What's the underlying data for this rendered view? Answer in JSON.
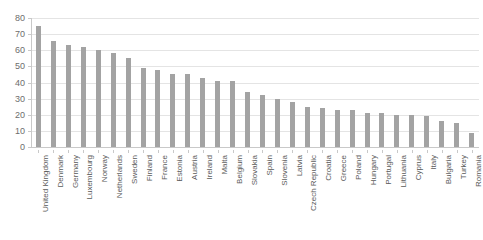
{
  "chart_data": {
    "type": "bar",
    "title": "",
    "subtitle": "",
    "xlabel": "",
    "ylabel": "",
    "ylim": [
      0,
      80
    ],
    "ytick_labels": [
      "0",
      "10",
      "20",
      "30",
      "40",
      "50",
      "60",
      "70",
      "80"
    ],
    "yticks": [
      0,
      10,
      20,
      30,
      40,
      50,
      60,
      70,
      80
    ],
    "grid": true,
    "legend": null,
    "legend_position": "none",
    "bar_color": "#a3a3a3",
    "background_color": "#ffffff",
    "axis_color": "#c9c9c9",
    "gridline_color": "#e4e4e4",
    "tick_label_color": "#6d6d6d",
    "category_label_color": "#5a5a5a",
    "category_label_rotation": -90,
    "categories": [
      "United Kingdom",
      "Denmark",
      "Germany",
      "Luxembourg",
      "Norway",
      "Netherlands",
      "Sweden",
      "Finland",
      "France",
      "Estonia",
      "Austria",
      "Ireland",
      "Malta",
      "Belgium",
      "Slovakia",
      "Spain",
      "Slovenia",
      "Latvia",
      "Czech Republic",
      "Croatia",
      "Greece",
      "Poland",
      "Hungary",
      "Portugal",
      "Lithuania",
      "Cyprus",
      "Italy",
      "Bulgaria",
      "Turkey",
      "Romania"
    ],
    "values": [
      75,
      66,
      63,
      62,
      60,
      58,
      55,
      49,
      48,
      45,
      45,
      43,
      41,
      41,
      34,
      32,
      30,
      28,
      25,
      24,
      23,
      23,
      21,
      21,
      20,
      20,
      19,
      16,
      15,
      9
    ]
  }
}
